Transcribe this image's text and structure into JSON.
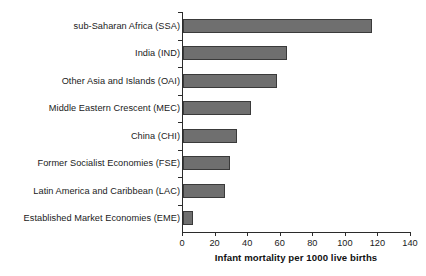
{
  "chart_data": {
    "type": "bar",
    "orientation": "horizontal",
    "title": "",
    "xlabel": "Infant mortality per 1000 live births",
    "ylabel": "",
    "xlim": [
      0,
      140
    ],
    "xticks": [
      0,
      20,
      40,
      60,
      80,
      100,
      120,
      140
    ],
    "grid": false,
    "legend": false,
    "bar_color": "#6f6f6f",
    "bar_edge_color": "#3a3a3a",
    "axis_color": "#2b2b2b",
    "categories": [
      "sub-Saharan Africa (SSA)",
      "India (IND)",
      "Other Asia and Islands (OAI)",
      "Middle Eastern Crescent (MEC)",
      "China (CHI)",
      "Former Socialist Economies (FSE)",
      "Latin America and Caribbean (LAC)",
      "Established Market Economies (EME)"
    ],
    "values": [
      116,
      64,
      58,
      42,
      33,
      29,
      26,
      6
    ],
    "series": [
      {
        "name": "Infant mortality per 1000 live births",
        "values": [
          116,
          64,
          58,
          42,
          33,
          29,
          26,
          6
        ]
      }
    ]
  }
}
